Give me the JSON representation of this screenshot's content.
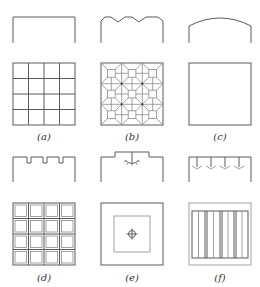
{
  "figure": {
    "panels": [
      {
        "id": "a",
        "label": "(a)",
        "section": "flat-ceiling",
        "plan": "4x4-grid"
      },
      {
        "id": "b",
        "label": "(b)",
        "section": "coffered-zigzag-ceiling",
        "plan": "3x3-octagonal-coffer-pattern"
      },
      {
        "id": "c",
        "label": "(c)",
        "section": "arched-ceiling",
        "plan": "plain-square"
      },
      {
        "id": "d",
        "label": "(d)",
        "section": "notched-ceiling",
        "plan": "4x4-recessed-panels"
      },
      {
        "id": "e",
        "label": "(e)",
        "section": "stepped-ceiling-with-central-light",
        "plan": "nested-square-with-center-fixture"
      },
      {
        "id": "f",
        "label": "(f)",
        "section": "ceiling-with-four-pendant-lights",
        "plan": "vertical-strip-panels"
      }
    ],
    "colors": {
      "line": "#5a5a5a",
      "line_light": "#8a8a8a",
      "background": "#ffffff"
    }
  }
}
